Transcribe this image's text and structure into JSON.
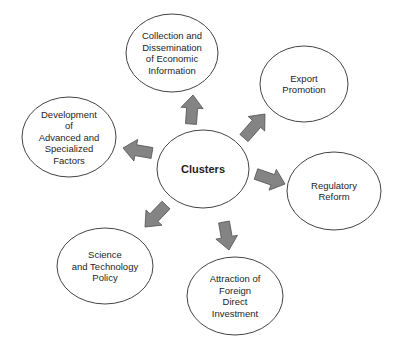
{
  "diagram": {
    "type": "hub-and-spoke",
    "center": {
      "id": "clusters",
      "label": "Clusters",
      "cx": 203,
      "cy": 169,
      "rx": 46,
      "ry": 39
    },
    "nodes": [
      {
        "id": "info",
        "lines": [
          "Collection and",
          "Dissemination",
          "of Economic",
          "Information"
        ],
        "cx": 172,
        "cy": 53,
        "rx": 46,
        "ry": 39
      },
      {
        "id": "export",
        "lines": [
          "Export",
          "Promotion"
        ],
        "cx": 304,
        "cy": 84,
        "rx": 44,
        "ry": 38
      },
      {
        "id": "factors",
        "lines": [
          "Development",
          "of",
          "Advanced and",
          "Specialized",
          "Factors"
        ],
        "cx": 69,
        "cy": 137,
        "rx": 47,
        "ry": 40
      },
      {
        "id": "regulatory",
        "lines": [
          "Regulatory",
          "Reform"
        ],
        "cx": 334,
        "cy": 191,
        "rx": 47,
        "ry": 39
      },
      {
        "id": "science",
        "lines": [
          "Science",
          "and Technology",
          "Policy"
        ],
        "cx": 105,
        "cy": 266,
        "rx": 48,
        "ry": 38
      },
      {
        "id": "fdi",
        "lines": [
          "Attraction of",
          "Foreign",
          "Direct",
          "Investment"
        ],
        "cx": 235,
        "cy": 296,
        "rx": 48,
        "ry": 39
      }
    ],
    "arrows": [
      {
        "to": "info",
        "from": [
          191,
          124
        ],
        "tip": [
          193,
          95
        ]
      },
      {
        "to": "export",
        "from": [
          244,
          138
        ],
        "tip": [
          265,
          114
        ]
      },
      {
        "to": "factors",
        "from": [
          152,
          153
        ],
        "tip": [
          123,
          148
        ]
      },
      {
        "to": "regulatory",
        "from": [
          256,
          174
        ],
        "tip": [
          285,
          184
        ]
      },
      {
        "to": "science",
        "from": [
          166,
          205
        ],
        "tip": [
          145,
          227
        ]
      },
      {
        "to": "fdi",
        "from": [
          224,
          222
        ],
        "tip": [
          229,
          250
        ]
      }
    ],
    "colors": {
      "arrow_fill": "#848484",
      "arrow_stroke": "#505050",
      "ellipse_stroke": "#444444"
    }
  }
}
